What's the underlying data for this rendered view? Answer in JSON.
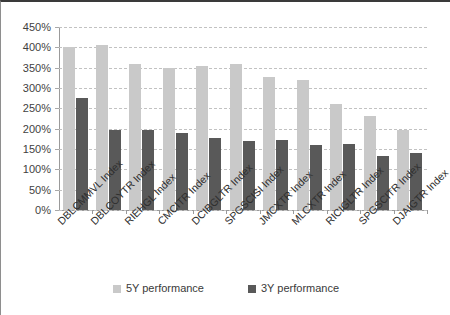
{
  "chart_data": {
    "type": "bar",
    "title": "",
    "xlabel": "",
    "ylabel": "",
    "ylim": [
      0,
      450
    ],
    "ytick_step": 50,
    "ytick_labels": [
      "450%",
      "400%",
      "350%",
      "300%",
      "250%",
      "200%",
      "150%",
      "100%",
      "50%",
      "0%"
    ],
    "ytick_values": [
      450,
      400,
      350,
      300,
      250,
      200,
      150,
      100,
      50,
      0
    ],
    "grid": true,
    "grid_style": "dashed-horizontal",
    "legend_position": "bottom-center",
    "value_suffix": "%",
    "categories": [
      "DBLCMMVL Index",
      "DBLCOYTR Index",
      "RIEHGL Index",
      "CMCITR Index",
      "DCIBGLTR Index",
      "SPGSCISI Index",
      "JMCXTR Index",
      "MLCXTR Index",
      "RICIGLTR Index",
      "SPGSCITR Index",
      "DJAIGTR Index"
    ],
    "series": [
      {
        "name": "5Y performance",
        "color": "#c9c9c9",
        "values": [
          400,
          405,
          360,
          350,
          355,
          360,
          328,
          320,
          260,
          232,
          197
        ]
      },
      {
        "name": "3Y performance",
        "color": "#595959",
        "values": [
          275,
          197,
          197,
          190,
          178,
          170,
          173,
          160,
          163,
          132,
          140
        ]
      }
    ]
  },
  "legend": {
    "entries": [
      {
        "label": "5Y performance",
        "color": "#c9c9c9",
        "swatch_name": "legend-swatch-5y"
      },
      {
        "label": "3Y performance",
        "color": "#595959",
        "swatch_name": "legend-swatch-3y"
      }
    ]
  }
}
